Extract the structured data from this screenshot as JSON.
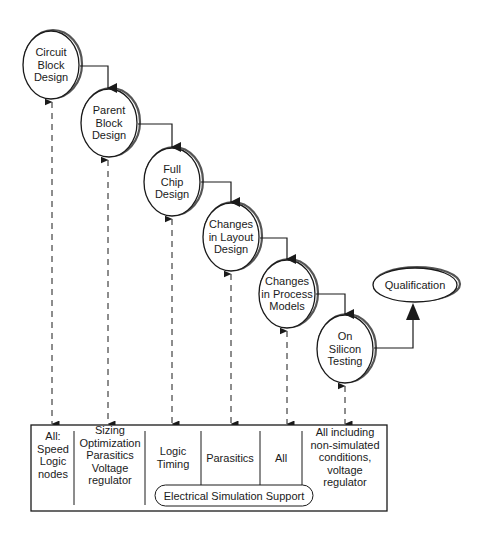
{
  "diagram": {
    "nodes": [
      {
        "id": "circuit-block-design",
        "lines": [
          "Circuit",
          "Block",
          "Design"
        ],
        "cx": 51,
        "cy": 65
      },
      {
        "id": "parent-block-design",
        "lines": [
          "Parent",
          "Block",
          "Design"
        ],
        "cx": 109,
        "cy": 123
      },
      {
        "id": "full-chip-design",
        "lines": [
          "Full",
          "Chip",
          "Design"
        ],
        "cx": 172,
        "cy": 182
      },
      {
        "id": "changes-in-layout-design",
        "lines": [
          "Changes",
          "in Layout",
          "Design"
        ],
        "cx": 231,
        "cy": 237
      },
      {
        "id": "changes-in-process-models",
        "lines": [
          "Changes",
          "in Process",
          "Models"
        ],
        "cx": 287,
        "cy": 294
      },
      {
        "id": "on-silicon-testing",
        "lines": [
          "On",
          "Silicon",
          "Testing"
        ],
        "cx": 345,
        "cy": 349
      }
    ],
    "final_node": {
      "id": "qualification",
      "label": "Qualification",
      "cx": 415,
      "cy": 285
    },
    "support_box": {
      "cells": [
        {
          "id": "all-speed-logic-nodes",
          "lines": [
            "All:",
            "Speed",
            "Logic",
            "nodes"
          ]
        },
        {
          "id": "sizing-optimization",
          "lines": [
            "Sizing",
            "Optimization",
            "Parasitics",
            "Voltage",
            "regulator"
          ]
        },
        {
          "id": "logic-timing",
          "lines": [
            "Logic",
            "Timing"
          ]
        },
        {
          "id": "parasitics",
          "lines": [
            "Parasitics"
          ]
        },
        {
          "id": "all",
          "lines": [
            "All"
          ]
        },
        {
          "id": "all-including",
          "lines": [
            "All including",
            "non-simulated",
            "conditions,",
            "voltage",
            "regulator"
          ]
        }
      ],
      "pill_label": "Electrical Simulation Support"
    },
    "colors": {
      "stroke": "#1a1a1a",
      "background": "#ffffff",
      "shadow": "#555555"
    }
  }
}
